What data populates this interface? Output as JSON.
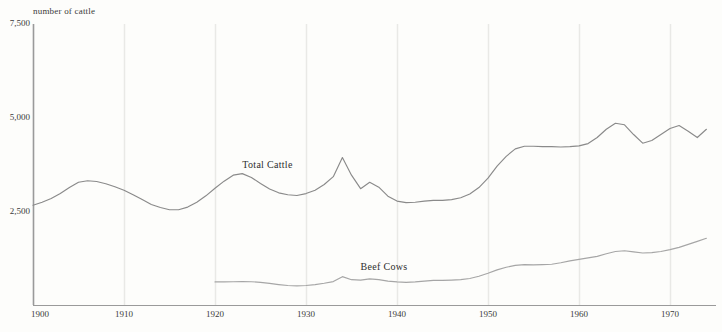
{
  "chart_data": {
    "type": "line",
    "title": "",
    "subtitle": "",
    "ylabel": "number of cattle",
    "xlabel": "",
    "xlim": [
      1900,
      1974
    ],
    "ylim": [
      0,
      7500
    ],
    "grid": "vertical-decades",
    "legend_position": "inline-annotation",
    "yticks": [
      2500,
      5000,
      7500
    ],
    "ytick_labels": [
      "2,500",
      "5,000",
      "7,500"
    ],
    "xticks": [
      1900,
      1910,
      1920,
      1930,
      1940,
      1950,
      1960,
      1970
    ],
    "xtick_labels": [
      "1900",
      "1910",
      "1920",
      "1930",
      "1940",
      "1950",
      "1960",
      "1970"
    ],
    "series": [
      {
        "name": "Total Cattle",
        "color": "#8a8a8a",
        "label_x": 1923,
        "label_y": 3720,
        "x": [
          1900,
          1901,
          1902,
          1903,
          1904,
          1905,
          1906,
          1907,
          1908,
          1909,
          1910,
          1911,
          1912,
          1913,
          1914,
          1915,
          1916,
          1917,
          1918,
          1919,
          1920,
          1921,
          1922,
          1923,
          1924,
          1925,
          1926,
          1927,
          1928,
          1929,
          1930,
          1931,
          1932,
          1933,
          1934,
          1935,
          1936,
          1937,
          1938,
          1939,
          1940,
          1941,
          1942,
          1943,
          1944,
          1945,
          1946,
          1947,
          1948,
          1949,
          1950,
          1951,
          1952,
          1953,
          1954,
          1955,
          1956,
          1957,
          1958,
          1959,
          1960,
          1961,
          1962,
          1963,
          1964,
          1965,
          1966,
          1967,
          1968,
          1969,
          1970,
          1971,
          1972,
          1973,
          1974
        ],
        "values": [
          2680,
          2760,
          2860,
          2990,
          3150,
          3290,
          3330,
          3310,
          3250,
          3170,
          3080,
          2960,
          2830,
          2700,
          2620,
          2560,
          2560,
          2630,
          2760,
          2930,
          3130,
          3320,
          3480,
          3520,
          3420,
          3260,
          3110,
          3010,
          2960,
          2940,
          2990,
          3080,
          3230,
          3440,
          3950,
          3480,
          3120,
          3290,
          3160,
          2920,
          2790,
          2750,
          2760,
          2790,
          2810,
          2810,
          2830,
          2880,
          2980,
          3150,
          3400,
          3720,
          3980,
          4180,
          4250,
          4250,
          4240,
          4240,
          4230,
          4240,
          4260,
          4320,
          4480,
          4700,
          4860,
          4820,
          4560,
          4330,
          4400,
          4560,
          4720,
          4800,
          4650,
          4480,
          4700
        ],
        "note": "values read from axis; 1934 spike to ~3,950 then sharp fall"
      },
      {
        "name": "Beef Cows",
        "color": "#a6a6a6",
        "label_x": 1936,
        "label_y": 1020,
        "x": [
          1920,
          1921,
          1922,
          1923,
          1924,
          1925,
          1926,
          1927,
          1928,
          1929,
          1930,
          1931,
          1932,
          1933,
          1934,
          1935,
          1936,
          1937,
          1938,
          1939,
          1940,
          1941,
          1942,
          1943,
          1944,
          1945,
          1946,
          1947,
          1948,
          1949,
          1950,
          1951,
          1952,
          1953,
          1954,
          1955,
          1956,
          1957,
          1958,
          1959,
          1960,
          1961,
          1962,
          1963,
          1964,
          1965,
          1966,
          1967,
          1968,
          1969,
          1970,
          1971,
          1972,
          1973,
          1974
        ],
        "values": [
          640,
          640,
          645,
          650,
          645,
          630,
          600,
          570,
          545,
          535,
          545,
          570,
          605,
          650,
          780,
          700,
          690,
          720,
          700,
          660,
          640,
          630,
          640,
          660,
          680,
          680,
          690,
          700,
          730,
          790,
          870,
          960,
          1030,
          1080,
          1100,
          1095,
          1100,
          1110,
          1150,
          1200,
          1240,
          1280,
          1320,
          1390,
          1450,
          1470,
          1440,
          1410,
          1420,
          1450,
          1500,
          1560,
          1640,
          1720,
          1800
        ],
        "note": "begins 1920; small 1934 bump; steady rise post-1949"
      }
    ]
  },
  "axis": {
    "y_title": "number of cattle"
  }
}
